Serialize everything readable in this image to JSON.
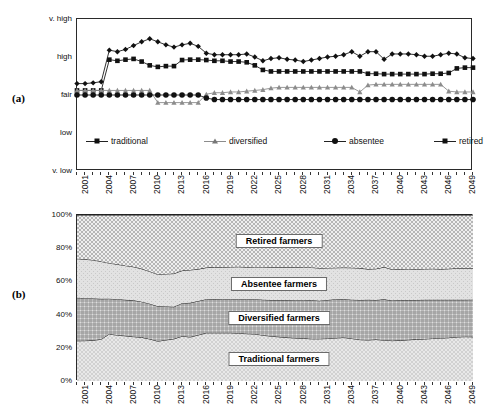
{
  "figure": {
    "panel_a_letter": "(a)",
    "panel_b_letter": "(b)"
  },
  "chart_data": [
    {
      "panel": "(a)",
      "type": "line",
      "title": "",
      "xlabel": "",
      "ylabel": "",
      "ytick_labels": [
        "v. low",
        "low",
        "fair",
        "high",
        "v. high"
      ],
      "ylim": [
        0,
        4
      ],
      "grid": false,
      "legend_position": "inside-bottom",
      "x": [
        2001,
        2002,
        2003,
        2004,
        2005,
        2006,
        2007,
        2008,
        2009,
        2010,
        2011,
        2012,
        2013,
        2014,
        2015,
        2016,
        2017,
        2018,
        2019,
        2020,
        2021,
        2022,
        2023,
        2024,
        2025,
        2026,
        2027,
        2028,
        2029,
        2030,
        2031,
        2032,
        2033,
        2034,
        2035,
        2036,
        2037,
        2038,
        2039,
        2040,
        2041,
        2042,
        2043,
        2044,
        2045,
        2046,
        2047,
        2048,
        2049,
        2050
      ],
      "xtick_labels": [
        "2001",
        "2004",
        "2007",
        "2010",
        "2013",
        "2016",
        "2019",
        "2022",
        "2025",
        "2028",
        "2031",
        "2034",
        "2037",
        "2040",
        "2043",
        "2046",
        "2049"
      ],
      "series": [
        {
          "name": "traditional",
          "marker": "square",
          "values": [
            2.12,
            2.12,
            2.12,
            2.12,
            2.93,
            2.9,
            2.93,
            2.95,
            2.88,
            2.78,
            2.74,
            2.76,
            2.76,
            2.92,
            2.93,
            2.93,
            2.92,
            2.9,
            2.9,
            2.88,
            2.88,
            2.86,
            2.78,
            2.66,
            2.62,
            2.62,
            2.62,
            2.62,
            2.62,
            2.62,
            2.62,
            2.62,
            2.62,
            2.62,
            2.62,
            2.62,
            2.56,
            2.56,
            2.55,
            2.55,
            2.55,
            2.55,
            2.55,
            2.55,
            2.56,
            2.56,
            2.58,
            2.7,
            2.72,
            2.72
          ]
        },
        {
          "name": "diversified",
          "marker": "triangle",
          "values": [
            2.12,
            2.12,
            2.12,
            2.12,
            2.12,
            2.12,
            2.12,
            2.12,
            2.12,
            2.12,
            1.8,
            1.8,
            1.8,
            1.8,
            1.8,
            1.8,
            2.02,
            2.06,
            2.06,
            2.08,
            2.08,
            2.1,
            2.12,
            2.14,
            2.18,
            2.2,
            2.2,
            2.2,
            2.2,
            2.2,
            2.2,
            2.2,
            2.2,
            2.2,
            2.2,
            2.08,
            2.26,
            2.28,
            2.28,
            2.28,
            2.28,
            2.28,
            2.28,
            2.28,
            2.28,
            2.28,
            2.1,
            2.08,
            2.08,
            2.08
          ]
        },
        {
          "name": "absentee",
          "marker": "circle",
          "values": [
            2.0,
            2.0,
            2.0,
            2.0,
            2.0,
            2.0,
            2.0,
            2.0,
            2.0,
            2.0,
            2.0,
            2.0,
            2.0,
            2.0,
            2.0,
            2.0,
            1.92,
            1.88,
            1.88,
            1.88,
            1.88,
            1.88,
            1.88,
            1.88,
            1.88,
            1.88,
            1.88,
            1.88,
            1.88,
            1.88,
            1.88,
            1.88,
            1.88,
            1.88,
            1.88,
            1.88,
            1.88,
            1.88,
            1.88,
            1.88,
            1.88,
            1.88,
            1.88,
            1.88,
            1.88,
            1.88,
            1.88,
            1.88,
            1.88,
            1.88
          ]
        },
        {
          "name": "retired",
          "marker": "diamond",
          "values": [
            2.3,
            2.3,
            2.32,
            2.35,
            3.18,
            3.14,
            3.2,
            3.3,
            3.4,
            3.48,
            3.4,
            3.32,
            3.26,
            3.32,
            3.36,
            3.28,
            3.1,
            3.06,
            3.06,
            3.06,
            3.06,
            3.08,
            3.0,
            2.9,
            2.96,
            2.98,
            2.94,
            2.92,
            2.88,
            2.92,
            2.96,
            3.0,
            3.02,
            3.06,
            3.14,
            3.02,
            3.14,
            3.14,
            2.94,
            3.08,
            3.08,
            3.08,
            3.06,
            3.02,
            3.02,
            3.06,
            3.1,
            3.08,
            2.98,
            2.96
          ]
        }
      ]
    },
    {
      "panel": "(b)",
      "type": "area",
      "title": "",
      "xlabel": "",
      "ylabel": "",
      "stacked": true,
      "ytick_labels": [
        "0%",
        "20%",
        "40%",
        "60%",
        "80%",
        "100%"
      ],
      "ytick_values": [
        0,
        20,
        40,
        60,
        80,
        100
      ],
      "ylim": [
        0,
        100
      ],
      "grid": false,
      "x": [
        2001,
        2002,
        2003,
        2004,
        2005,
        2006,
        2007,
        2008,
        2009,
        2010,
        2011,
        2012,
        2013,
        2014,
        2015,
        2016,
        2017,
        2018,
        2019,
        2020,
        2021,
        2022,
        2023,
        2024,
        2025,
        2026,
        2027,
        2028,
        2029,
        2030,
        2031,
        2032,
        2033,
        2034,
        2035,
        2036,
        2037,
        2038,
        2039,
        2040,
        2041,
        2042,
        2043,
        2044,
        2045,
        2046,
        2047,
        2048,
        2049,
        2050
      ],
      "xtick_labels": [
        "2001",
        "2004",
        "2007",
        "2010",
        "2013",
        "2016",
        "2019",
        "2022",
        "2025",
        "2028",
        "2031",
        "2034",
        "2037",
        "2040",
        "2043",
        "2046",
        "2049"
      ],
      "series": [
        {
          "name": "Traditional farmers",
          "label": "Traditional farmers",
          "values": [
            24.2,
            24.3,
            24.5,
            25.2,
            28.3,
            27.6,
            27.2,
            26.7,
            26.3,
            25.3,
            24.0,
            24.7,
            25.4,
            27.0,
            26.5,
            27.7,
            29.0,
            29.0,
            29.0,
            29.0,
            28.8,
            28.5,
            28.3,
            27.6,
            27.0,
            26.6,
            26.2,
            25.9,
            25.7,
            25.4,
            25.4,
            25.6,
            25.9,
            26.2,
            25.6,
            24.9,
            24.7,
            25.0,
            24.6,
            24.3,
            24.5,
            24.8,
            25.1,
            25.3,
            25.6,
            25.8,
            26.1,
            26.5,
            26.7,
            26.6
          ]
        },
        {
          "name": "Diversified farmers",
          "label": "Diversified farmers",
          "values": [
            25.9,
            25.6,
            25.2,
            24.3,
            21.3,
            21.7,
            21.7,
            21.9,
            21.5,
            21.3,
            21.0,
            20.2,
            19.3,
            19.9,
            20.6,
            20.5,
            20.3,
            20.4,
            20.3,
            20.3,
            20.5,
            20.8,
            21.0,
            21.4,
            21.8,
            22.2,
            22.6,
            22.8,
            23.0,
            23.2,
            23.0,
            23.2,
            23.4,
            23.0,
            23.4,
            23.9,
            24.2,
            23.8,
            24.6,
            24.2,
            24.3,
            24.0,
            23.7,
            23.6,
            23.3,
            23.1,
            22.8,
            22.4,
            22.2,
            22.4
          ]
        },
        {
          "name": "Absentee farmers",
          "label": "Absentee farmers",
          "values": [
            23.6,
            23.4,
            23.2,
            22.5,
            21.4,
            21.0,
            20.6,
            20.2,
            19.8,
            19.4,
            19.2,
            19.6,
            20.0,
            19.6,
            19.8,
            19.2,
            19.0,
            19.2,
            19.2,
            19.4,
            19.5,
            19.3,
            19.4,
            19.7,
            19.8,
            19.8,
            19.8,
            19.9,
            19.7,
            19.8,
            19.6,
            19.3,
            18.9,
            19.1,
            19.2,
            19.2,
            18.5,
            18.8,
            19.4,
            18.7,
            18.6,
            18.7,
            18.5,
            18.6,
            18.7,
            18.5,
            18.7,
            19.0,
            19.1,
            19.0
          ]
        },
        {
          "name": "Retired farmers",
          "label": "Retired farmers",
          "values": [
            26.3,
            26.7,
            27.1,
            28.0,
            29.0,
            29.7,
            30.5,
            31.2,
            32.4,
            34.0,
            35.8,
            35.5,
            35.3,
            33.5,
            33.1,
            32.6,
            31.7,
            31.4,
            31.5,
            31.3,
            31.2,
            31.4,
            31.3,
            31.3,
            31.4,
            31.4,
            31.4,
            31.4,
            31.6,
            31.6,
            32.0,
            31.9,
            31.8,
            31.7,
            31.8,
            32.0,
            32.6,
            32.4,
            31.4,
            32.8,
            32.6,
            32.5,
            32.7,
            32.5,
            32.4,
            32.6,
            32.4,
            32.1,
            32.0,
            32.0
          ]
        }
      ]
    }
  ]
}
